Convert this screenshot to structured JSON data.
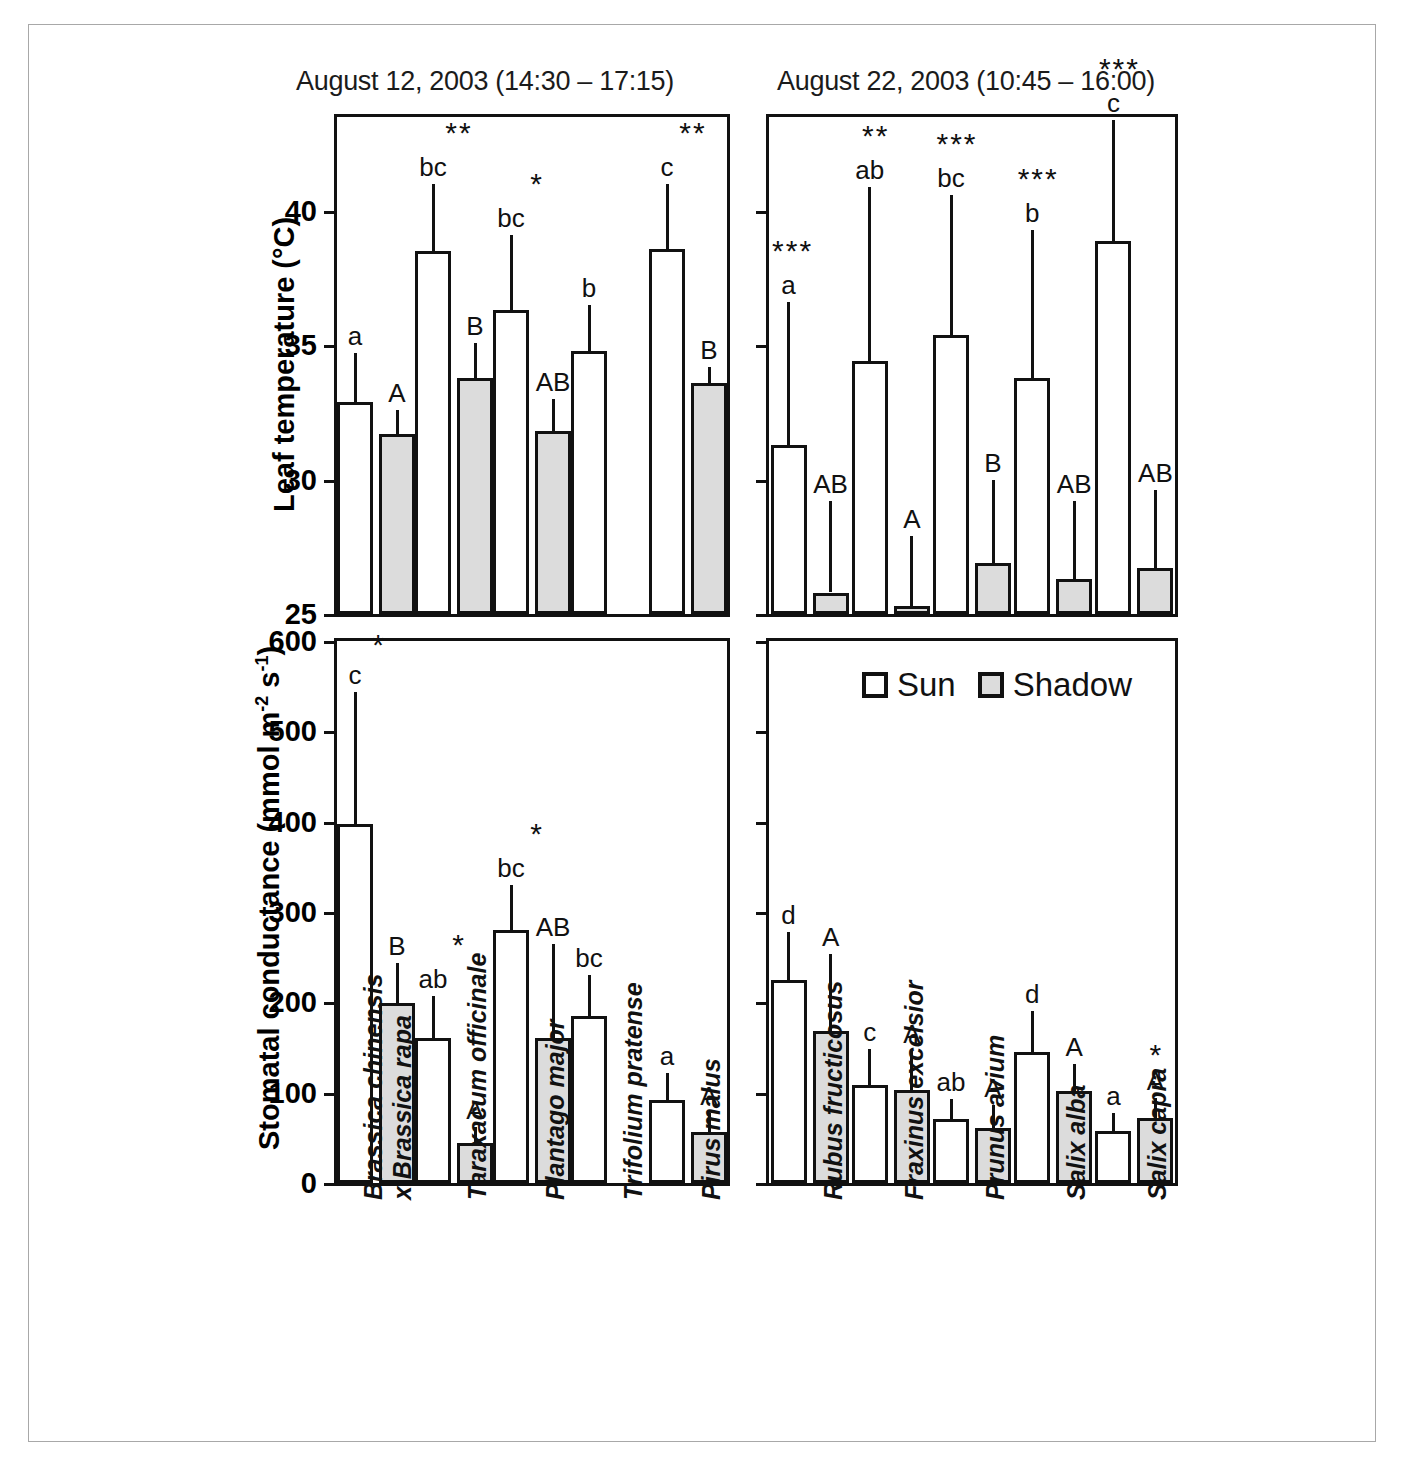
{
  "figure": {
    "panels": [
      {
        "id": "top-left",
        "title": "August 12, 2003 (14:30 – 17:15)"
      },
      {
        "id": "top-right",
        "title": "August 22, 2003 (10:45 – 16:00)"
      }
    ],
    "axis_titles": {
      "leaf_temperature": "Leaf temperature (°C)",
      "stomatal_conductance": "Stomatal conductance  (mmol m-2 s-1)",
      "stomatal_conductance_parts": {
        "prefix": "Stomatal conductance  (mmol m",
        "sup1": "-2",
        "mid": " s",
        "sup2": "-1",
        "suffix": ")"
      }
    },
    "legend": {
      "items": [
        {
          "key": "sun",
          "label": "Sun",
          "color": "#ffffff"
        },
        {
          "key": "shadow",
          "label": "Shadow",
          "color": "#dcdcdc"
        }
      ]
    },
    "no_data_label": "n. d."
  },
  "chart_data": [
    {
      "id": "top-left",
      "type": "bar",
      "title": "August 12, 2003 (14:30 – 17:15)",
      "xlabel": "",
      "ylabel": "Leaf temperature (°C)",
      "ylim": [
        25,
        43.5
      ],
      "yticks": [
        25,
        30,
        35,
        40
      ],
      "grid": false,
      "legend": "none",
      "categories": [
        "Brassica chinensis x Brassica rapa",
        "Taraxacum officinale",
        "Plantago major",
        "Trifolium pratense",
        "Pirus malus"
      ],
      "series": [
        {
          "name": "Sun",
          "values": [
            32.9,
            38.5,
            36.3,
            34.8,
            38.6
          ],
          "errors": [
            1.8,
            2.5,
            2.8,
            1.7,
            2.4
          ]
        },
        {
          "name": "Shadow",
          "values": [
            31.7,
            33.8,
            31.8,
            null,
            33.6
          ],
          "errors": [
            0.9,
            1.3,
            1.2,
            null,
            0.6
          ]
        }
      ],
      "letters": {
        "sun": [
          "a",
          "bc",
          "bc",
          "b",
          "c"
        ],
        "shadow": [
          "A",
          "B",
          "AB",
          null,
          "B"
        ]
      },
      "significance": [
        null,
        "**",
        "*",
        null,
        "**"
      ],
      "annotations": [
        {
          "category": "Trifolium pratense",
          "series": "Shadow",
          "text": "n. d."
        }
      ]
    },
    {
      "id": "top-right",
      "type": "bar",
      "title": "August 22, 2003 (10:45 – 16:00)",
      "xlabel": "",
      "ylabel": "Leaf temperature (°C)",
      "ylim": [
        25,
        43.5
      ],
      "yticks": [
        25,
        30,
        35,
        40
      ],
      "grid": false,
      "legend": "none",
      "categories": [
        "Rubus fructicosus",
        "Fraxinus excelsior",
        "Prunus avium",
        "Salix alba",
        "Salix capra"
      ],
      "series": [
        {
          "name": "Sun",
          "values": [
            31.3,
            34.4,
            35.4,
            33.8,
            38.9
          ],
          "errors": [
            5.3,
            6.5,
            5.2,
            5.5,
            4.5
          ]
        },
        {
          "name": "Shadow",
          "values": [
            25.8,
            25.3,
            26.9,
            26.3,
            26.7
          ],
          "errors": [
            3.4,
            2.6,
            3.1,
            2.9,
            2.9
          ]
        }
      ],
      "letters": {
        "sun": [
          "a",
          "ab",
          "bc",
          "b",
          "c"
        ],
        "shadow": [
          "AB",
          "A",
          "B",
          "AB",
          "AB"
        ]
      },
      "significance": [
        "***",
        "**",
        "***",
        "***",
        "***"
      ],
      "annotations": []
    },
    {
      "id": "bottom-left",
      "type": "bar",
      "title": "",
      "xlabel": "",
      "ylabel": "Stomatal conductance  (mmol m-2 s-1)",
      "ylim": [
        0,
        600
      ],
      "yticks": [
        0,
        100,
        200,
        300,
        400,
        500,
        600
      ],
      "grid": false,
      "legend": "none",
      "categories": [
        "Brassica chinensis x Brassica rapa",
        "Taraxacum officinale",
        "Plantago major",
        "Trifolium pratense",
        "Pirus malus"
      ],
      "series": [
        {
          "name": "Sun",
          "values": [
            397,
            160,
            280,
            185,
            92
          ],
          "errors": [
            147,
            47,
            50,
            45,
            30
          ]
        },
        {
          "name": "Shadow",
          "values": [
            199,
            44,
            160,
            null,
            57
          ],
          "errors": [
            45,
            18,
            105,
            null,
            20
          ]
        }
      ],
      "letters": {
        "sun": [
          "c",
          "ab",
          "bc",
          "bc",
          "a"
        ],
        "shadow": [
          "B",
          "A",
          "AB",
          null,
          "A"
        ]
      },
      "significance": [
        "*",
        "*",
        "*",
        null,
        null
      ],
      "annotations": [
        {
          "category": "Trifolium pratense",
          "series": "Shadow",
          "text": "n. d."
        }
      ]
    },
    {
      "id": "bottom-right",
      "type": "bar",
      "title": "",
      "xlabel": "",
      "ylabel": "Stomatal conductance  (mmol m-2 s-1)",
      "ylim": [
        0,
        600
      ],
      "yticks": [
        0,
        100,
        200,
        300,
        400,
        500,
        600
      ],
      "grid": false,
      "legend": "top",
      "categories": [
        "Rubus fructicosus",
        "Fraxinus excelsior",
        "Prunus avium",
        "Salix alba",
        "Salix capra"
      ],
      "series": [
        {
          "name": "Sun",
          "values": [
            225,
            108,
            71,
            145,
            58
          ],
          "errors": [
            53,
            40,
            22,
            45,
            20
          ]
        },
        {
          "name": "Shadow",
          "values": [
            168,
            103,
            61,
            102,
            72
          ],
          "errors": [
            85,
            43,
            25,
            30,
            22
          ]
        }
      ],
      "letters": {
        "sun": [
          "d",
          "c",
          "ab",
          "d",
          "a"
        ],
        "shadow": [
          "A",
          "A",
          "A",
          "A",
          "A"
        ]
      },
      "significance": [
        null,
        null,
        null,
        null,
        "*"
      ],
      "annotations": []
    }
  ],
  "species_labels": {
    "left": [
      {
        "line1": "Brassica chinensis",
        "line2": "x Brassica rapa"
      },
      {
        "line1": "Taraxacum officinale",
        "line2": ""
      },
      {
        "line1": "Plantago major",
        "line2": ""
      },
      {
        "line1": "Trifolium pratense",
        "line2": ""
      },
      {
        "line1": "Pirus malus",
        "line2": ""
      }
    ],
    "right": [
      {
        "line1": "Rubus fructicosus",
        "line2": ""
      },
      {
        "line1": "Fraxinus excelsior",
        "line2": ""
      },
      {
        "line1": "Prunus avium",
        "line2": ""
      },
      {
        "line1": "Salix alba",
        "line2": ""
      },
      {
        "line1": "Salix capra",
        "line2": ""
      }
    ]
  },
  "colors": {
    "sun_fill": "#ffffff",
    "shadow_fill": "#dcdcdc",
    "stroke": "#111111",
    "frame": "#a8a8a8"
  }
}
